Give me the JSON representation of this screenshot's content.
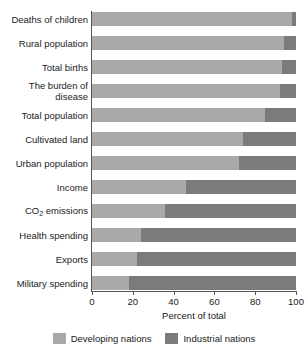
{
  "chart_data": {
    "type": "bar",
    "orientation": "horizontal",
    "stacked": true,
    "stack_total": 100,
    "title": "",
    "subtitle": "",
    "xlabel": "Percent of total",
    "ylabel": "",
    "xlim": [
      0,
      100
    ],
    "xticks": [
      0,
      20,
      40,
      60,
      80,
      100
    ],
    "xtick_labels": [
      "0",
      "20",
      "40",
      "60",
      "80",
      "100"
    ],
    "grid": false,
    "legend_position": "bottom",
    "categories": [
      "Deaths of children",
      "Rural population",
      "Total births",
      "The burden of disease",
      "Total population",
      "Cultivated land",
      "Urban population",
      "Income",
      "CO2 emissions",
      "Health spending",
      "Exports",
      "Military spending"
    ],
    "category_labels_display": [
      "Deaths of children",
      "Rural population",
      "Total births",
      "The burden of\ndisease",
      "Total population",
      "Cultivated land",
      "Urban population",
      "Income",
      "CO₂ emissions",
      "Health spending",
      "Exports",
      "Military spending"
    ],
    "series": [
      {
        "name": "Developing nations",
        "color": "#a9a9a9",
        "values": [
          98,
          94,
          93,
          92,
          85,
          74,
          72,
          46,
          36,
          24,
          22,
          18
        ]
      },
      {
        "name": "Industrial nations",
        "color": "#7b7b7b",
        "values": [
          2,
          6,
          7,
          8,
          15,
          26,
          28,
          54,
          64,
          76,
          78,
          82
        ]
      }
    ],
    "legend": [
      "Developing nations",
      "Industrial nations"
    ],
    "colors": {
      "developing": "#a9a9a9",
      "industrial": "#7b7b7b",
      "axis": "#555555",
      "text": "#1a1a1a",
      "background": "#ffffff"
    }
  },
  "legend": {
    "items": [
      {
        "label": "Developing nations",
        "swatch": "developing"
      },
      {
        "label": "Industrial nations",
        "swatch": "industrial"
      }
    ]
  },
  "axis": {
    "x_title": "Percent of total",
    "x_tick_labels": [
      "0",
      "20",
      "40",
      "60",
      "80",
      "100"
    ]
  }
}
